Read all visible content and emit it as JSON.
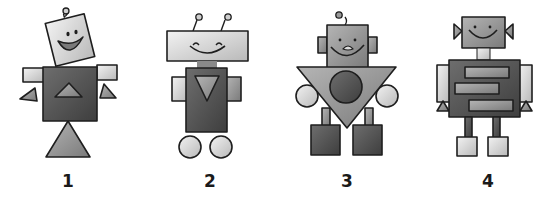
{
  "robots": [
    {
      "label": "1",
      "head_shape": "tilted-square",
      "body_shape": "square",
      "body_emblem": "triangle-up",
      "base": "triangle",
      "antennae": 1
    },
    {
      "label": "2",
      "head_shape": "wide-rectangle",
      "body_shape": "tall-rectangle",
      "body_emblem": "triangle-down",
      "base": "two-wheels",
      "antennae": 2
    },
    {
      "label": "3",
      "head_shape": "square",
      "body_shape": "inverted-triangle",
      "body_emblem": "circle",
      "base": "two-square-feet",
      "antennae": 1
    },
    {
      "label": "4",
      "head_shape": "square",
      "body_shape": "rectangle",
      "body_emblem": "three-bars",
      "base": "two-square-feet",
      "antennae": 0
    }
  ],
  "colors": {
    "dark": "#5a5a5a",
    "mid": "#8c8c8c",
    "light": "#d8d8d8",
    "outline": "#1e1e1e"
  }
}
